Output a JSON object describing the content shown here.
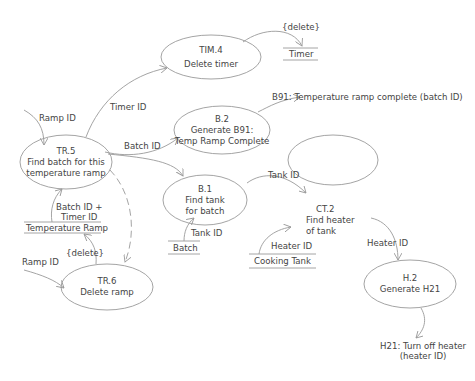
{
  "processes": {
    "tim4": {
      "id": "TIM.4",
      "name": "Delete timer"
    },
    "b2": {
      "id": "B.2",
      "line1": "Generate B91:",
      "line2": "Temp Ramp Complete"
    },
    "tr5": {
      "id": "TR.5",
      "line1": "Find batch for this",
      "line2": "temperature ramp"
    },
    "b1": {
      "id": "B.1",
      "line1": "Find tank",
      "line2": "for batch"
    },
    "ct2": {
      "id": "CT.2",
      "line1": "Find heater",
      "line2": "of tank"
    },
    "tr6": {
      "id": "TR.6",
      "name": "Delete ramp"
    },
    "h2": {
      "id": "H.2",
      "name": "Generate H21"
    }
  },
  "stores": {
    "timer": "Timer",
    "temperature_ramp": "Temperature Ramp",
    "batch": "Batch",
    "cooking_tank": "Cooking Tank"
  },
  "flows": {
    "delete_timer": "{delete}",
    "ramp_id_in": "Ramp ID",
    "timer_id": "Timer ID",
    "batch_id": "Batch ID",
    "b91_event": "B91: Temperature ramp complete (batch ID)",
    "batch_timer_id_1": "Batch ID +",
    "batch_timer_id_2": "Timer ID",
    "delete_ramp": "{delete}",
    "ramp_id_in_tr6": "Ramp ID",
    "tank_id_out": "Tank ID",
    "tank_id_in": "Tank ID",
    "heater_id_in": "Heater ID",
    "heater_id_out": "Heater ID",
    "h21_event_1": "H21: Turn off heater",
    "h21_event_2": "(heater ID)"
  },
  "colors": {
    "line": "#9a9a9a",
    "text": "#444444"
  }
}
